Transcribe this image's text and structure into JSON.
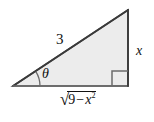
{
  "figure": {
    "name": "right-triangle-trig-diagram",
    "type": "geometry-diagram",
    "canvas": {
      "width": 154,
      "height": 122
    },
    "colors": {
      "fill": "#ececec",
      "stroke": "#4a4a4a",
      "text": "#111111",
      "background": "#ffffff"
    },
    "triangle": {
      "vertices": {
        "left": {
          "x": 13,
          "y": 86
        },
        "apex": {
          "x": 128,
          "y": 10
        },
        "right_angle": {
          "x": 128,
          "y": 86
        }
      }
    },
    "labels": {
      "hypotenuse": "3",
      "vertical_leg": "x",
      "angle": "θ",
      "base_radical_sign": "√",
      "base_radicand_number": "9",
      "base_radicand_operator": "−",
      "base_radicand_variable": "x",
      "base_radicand_exponent": "2",
      "base_full": "√(9 − x²)"
    },
    "markers": {
      "right_angle_square": "right-angle-marker",
      "angle_arc": "theta-angle-arc"
    }
  }
}
